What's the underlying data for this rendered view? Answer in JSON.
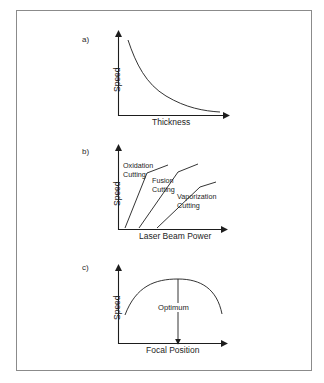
{
  "figure": {
    "background": "#ffffff",
    "frame_color": "#8b8b8b",
    "line_color": "#1d1d1d"
  },
  "panels": [
    {
      "id": "a",
      "letter": "a)",
      "y_axis_label": "Speed",
      "x_axis_label": "Thickness",
      "curve_type": "decaying-hyperbola",
      "curve_labels": []
    },
    {
      "id": "b",
      "letter": "b)",
      "y_axis_label": "Speed",
      "x_axis_label": "Laser Beam Power",
      "curve_type": "three-rising-lines",
      "curve_labels": [
        {
          "line1": "Oxidation",
          "line2": "Cutting"
        },
        {
          "line1": "Fusion",
          "line2": "Cutting"
        },
        {
          "line1": "Vaporization",
          "line2": "Cutting"
        }
      ]
    },
    {
      "id": "c",
      "letter": "c)",
      "y_axis_label": "Speed",
      "x_axis_label": "Focal Position",
      "curve_type": "inverted-parabola",
      "annotation": "Optimum",
      "curve_labels": []
    }
  ]
}
